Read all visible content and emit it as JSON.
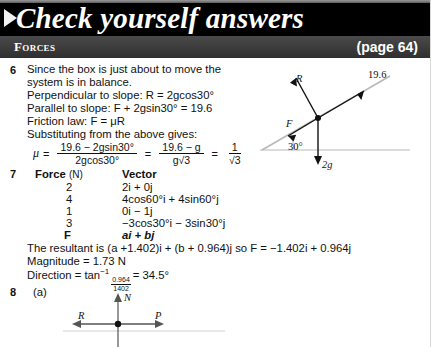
{
  "header": {
    "title": "Check yourself answers",
    "section": "Forces",
    "page_ref": "(page 64)",
    "arrow_icon": "triangle-right-icon",
    "bg_color": "#000000",
    "bar_color": "#3a3a3a",
    "text_color": "#ffffff"
  },
  "q6": {
    "number": "6",
    "lines": [
      "Since the box is just about to move the",
      "system is in balance."
    ],
    "perpendicular": "Perpendicular to slope: R = 2gcos30°",
    "parallel": "Parallel to slope: F + 2gsin30° = 19.6",
    "friction": "Friction law: F = μR",
    "substituting": "Substituting from the above gives:",
    "formula": {
      "lhs": "μ",
      "frac1_num": "19.6 − 2gsin30°",
      "frac1_den": "2gcos30°",
      "frac2_num": "19.6 − g",
      "frac2_den": "g√3",
      "frac3_num": "1",
      "frac3_den": "√3"
    },
    "diagram": {
      "name": "inclined-plane-diagram",
      "angle_label": "30°",
      "normal_label": "R",
      "applied_label": "19.6",
      "friction_label": "F",
      "weight_label": "2g"
    }
  },
  "q7": {
    "number": "7",
    "col1_header_bold": "Force",
    "col1_header_unit": "(N)",
    "col2_header": "Vector",
    "rows": [
      {
        "force": "2",
        "vector": "2i + 0j"
      },
      {
        "force": "4",
        "vector": "4cos60°i + 4sin60°j"
      },
      {
        "force": "1",
        "vector": "0i − 1j"
      },
      {
        "force": "3",
        "vector": "−3cos30°i − 3sin30°j"
      },
      {
        "force": "F",
        "vector": "ai + bj"
      }
    ],
    "resultant": "The resultant is (a +1.402)i + (b + 0.964)j so F = −1.402i + 0.964j",
    "magnitude": "Magnitude = 1.73 N",
    "direction_prefix": "Direction = tan",
    "direction_exp": "−1",
    "direction_num": "0.964",
    "direction_den": "1402",
    "direction_result": "= 34.5°"
  },
  "q8": {
    "number": "8",
    "part_label": "(a)",
    "diagram": {
      "name": "free-body-diagram",
      "up_label": "N",
      "left_label": "R",
      "right_label": "P"
    }
  }
}
